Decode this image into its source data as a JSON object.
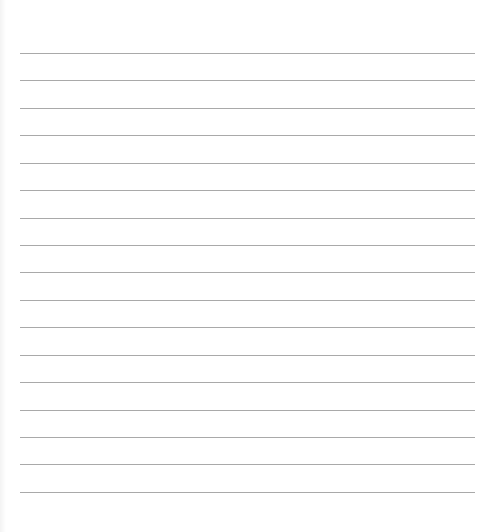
{
  "sheet": {
    "type": "lined-paper",
    "line_count": 17,
    "first_line_y": 53,
    "line_spacing": 27.43,
    "line_left": 20,
    "line_width": 455,
    "line_color": "#a9a9a9",
    "background_color": "#ffffff",
    "lines": [
      {
        "text": ""
      },
      {
        "text": ""
      },
      {
        "text": ""
      },
      {
        "text": ""
      },
      {
        "text": ""
      },
      {
        "text": ""
      },
      {
        "text": ""
      },
      {
        "text": ""
      },
      {
        "text": ""
      },
      {
        "text": ""
      },
      {
        "text": ""
      },
      {
        "text": ""
      },
      {
        "text": ""
      },
      {
        "text": ""
      },
      {
        "text": ""
      },
      {
        "text": ""
      },
      {
        "text": ""
      }
    ]
  }
}
